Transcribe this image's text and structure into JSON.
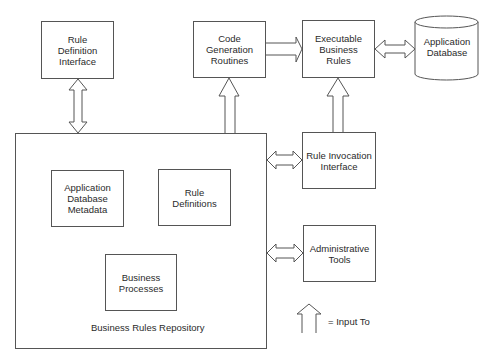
{
  "diagram": {
    "nodes": {
      "rule_definition_interface": "Rule\nDefinition\nInterface",
      "code_generation_routines": "Code Generation\nRoutines",
      "executable_business_rules": "Executable\nBusiness\nRules",
      "application_database": "Application\nDatabase",
      "rule_invocation_interface": "Rule Invocation\nInterface",
      "administrative_tools": "Administrative\nTools",
      "application_database_metadata": "Application\nDatabase\nMetadata",
      "rule_definitions": "Rule\nDefinitions",
      "business_processes": "Business\nProcesses",
      "business_rules_repository": "Business Rules Repository"
    },
    "edges": [
      {
        "from": "rule_definition_interface",
        "to": "business_rules_repository",
        "type": "bidirectional"
      },
      {
        "from": "business_rules_repository",
        "to": "code_generation_routines",
        "type": "input-to"
      },
      {
        "from": "code_generation_routines",
        "to": "executable_business_rules",
        "type": "input-to"
      },
      {
        "from": "executable_business_rules",
        "to": "application_database",
        "type": "bidirectional"
      },
      {
        "from": "rule_invocation_interface",
        "to": "executable_business_rules",
        "type": "input-to"
      },
      {
        "from": "business_rules_repository",
        "to": "rule_invocation_interface",
        "type": "bidirectional"
      },
      {
        "from": "business_rules_repository",
        "to": "administrative_tools",
        "type": "bidirectional"
      }
    ],
    "legend": {
      "input_to_label": "= Input To"
    }
  }
}
